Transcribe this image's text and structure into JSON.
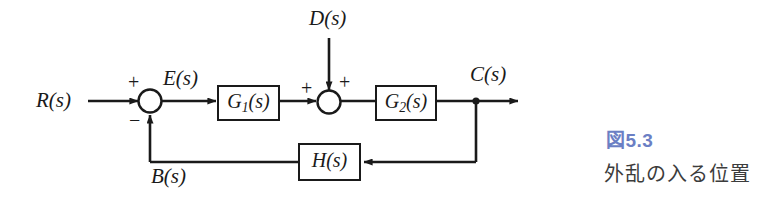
{
  "figure": {
    "type": "control-system-block-diagram",
    "background_color": "#ffffff",
    "line_color": "#1a1a1a",
    "accent_color": "#6b7fc4",
    "caption_color": "#3c3c3c"
  },
  "signals": {
    "reference_input": "R(s)",
    "error": "E(s)",
    "disturbance": "D(s)",
    "output": "C(s)",
    "feedback": "B(s)"
  },
  "blocks": [
    {
      "id": "g1",
      "label_main": "G",
      "label_sub": "1",
      "label_tail": "(s)",
      "label": "G1(s)"
    },
    {
      "id": "g2",
      "label_main": "G",
      "label_sub": "2",
      "label_tail": "(s)",
      "label": "G2(s)"
    },
    {
      "id": "h",
      "label_main": "H",
      "label_sub": "",
      "label_tail": "(s)",
      "label": "H(s)"
    }
  ],
  "summing_junctions": [
    {
      "id": "sum1",
      "signs": {
        "top_left": "+",
        "bottom": "−"
      }
    },
    {
      "id": "sum2",
      "signs": {
        "left": "+",
        "top_right": "+"
      }
    }
  ],
  "caption": {
    "figure_number": "図5.3",
    "title": "外乱の入る位置"
  }
}
